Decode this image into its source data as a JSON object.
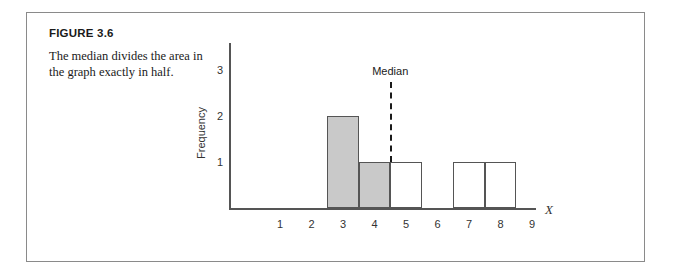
{
  "figure": {
    "label": "FIGURE 3.6",
    "caption": "The median divides the area in the graph exactly in half."
  },
  "chart_data": {
    "type": "bar",
    "title": "",
    "xlabel": "X",
    "ylabel": "Frequency",
    "categories": [
      "1",
      "2",
      "3",
      "4",
      "5",
      "6",
      "7",
      "8",
      "9"
    ],
    "values": [
      0,
      0,
      2,
      1,
      1,
      0,
      1,
      1,
      0
    ],
    "bar_styles": [
      "none",
      "none",
      "filled",
      "filled",
      "open",
      "none",
      "open",
      "open",
      "none"
    ],
    "fill_color": "#c9c9c9",
    "line_color": "#555555",
    "xlim": [
      0.5,
      9.5
    ],
    "ylim": [
      0,
      3.4
    ],
    "yticks": [
      "1",
      "2",
      "3"
    ],
    "ytick_values": [
      1,
      2,
      3
    ],
    "grid": false,
    "legend": false,
    "annotations": [
      {
        "name": "median",
        "label": "Median",
        "x": 4.5,
        "y_top": 2.75,
        "style": "dashed-vertical"
      }
    ]
  }
}
